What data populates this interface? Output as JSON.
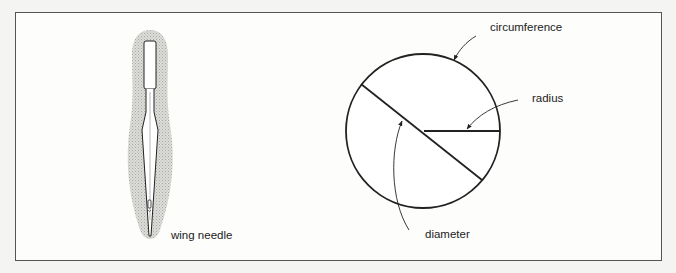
{
  "figure": {
    "left_panel": {
      "illustration": "wing-needle",
      "label": "wing needle"
    },
    "right_panel": {
      "illustration": "circle-parts",
      "labels": {
        "circumference": "circumference",
        "radius": "radius",
        "diameter": "diameter"
      }
    }
  },
  "colors": {
    "stroke": "#222222",
    "frame": "#555555",
    "shading": "#c8c8c4",
    "background": "#fdfdfc"
  }
}
